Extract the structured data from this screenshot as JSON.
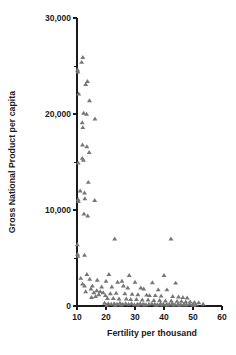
{
  "chart_data": {
    "type": "scatter",
    "title": "",
    "subtitle": "",
    "xlabel": "Fertility per thousand",
    "ylabel": "Gross National Product per capita",
    "xlim": [
      10,
      60
    ],
    "ylim": [
      0,
      30000
    ],
    "xticks": [
      10,
      20,
      30,
      40,
      50,
      60
    ],
    "xtick_labels": [
      "10",
      "20",
      "30",
      "40",
      "50",
      "60"
    ],
    "yticks": [
      0,
      10000,
      20000,
      30000
    ],
    "ytick_labels": [
      "0",
      "10,000",
      "20,000",
      "30,000"
    ],
    "yticks_minor": [
      5000,
      15000,
      25000
    ],
    "grid": false,
    "legend": null,
    "marker": "triangle",
    "marker_color": "#777777",
    "marker_size": 4,
    "axis_color": "#1a1a1a",
    "background_color": "#ffffff",
    "series": [
      {
        "name": "Countries",
        "points": [
          [
            10.2,
            24600
          ],
          [
            10.3,
            24400
          ],
          [
            11.6,
            25400
          ],
          [
            12.0,
            25900
          ],
          [
            10.6,
            22100
          ],
          [
            13.0,
            23100
          ],
          [
            13.6,
            23400
          ],
          [
            14.3,
            21400
          ],
          [
            12.3,
            20100
          ],
          [
            13.3,
            20000
          ],
          [
            16.2,
            19500
          ],
          [
            11.8,
            19100
          ],
          [
            12.0,
            18600
          ],
          [
            11.9,
            16800
          ],
          [
            13.4,
            16600
          ],
          [
            14.2,
            16000
          ],
          [
            11.8,
            15400
          ],
          [
            12.2,
            15200
          ],
          [
            10.4,
            14900
          ],
          [
            13.9,
            12900
          ],
          [
            11.1,
            12000
          ],
          [
            12.6,
            11800
          ],
          [
            10.4,
            11100
          ],
          [
            10.5,
            10900
          ],
          [
            12.7,
            11200
          ],
          [
            16.1,
            11000
          ],
          [
            12.4,
            9600
          ],
          [
            13.7,
            9400
          ],
          [
            10.1,
            6400
          ],
          [
            10.2,
            5400
          ],
          [
            10.3,
            5200
          ],
          [
            12.6,
            5300
          ],
          [
            23.0,
            7000
          ],
          [
            42.4,
            7000
          ],
          [
            13.4,
            3300
          ],
          [
            21.0,
            3300
          ],
          [
            28.0,
            3200
          ],
          [
            40.0,
            3200
          ],
          [
            11.3,
            2900
          ],
          [
            14.4,
            2800
          ],
          [
            17.0,
            2700
          ],
          [
            20.0,
            2600
          ],
          [
            24.0,
            2500
          ],
          [
            25.5,
            2600
          ],
          [
            30.0,
            2500
          ],
          [
            36.0,
            2450
          ],
          [
            44.0,
            2400
          ],
          [
            11.9,
            2300
          ],
          [
            12.6,
            2100
          ],
          [
            15.3,
            2100
          ],
          [
            18.5,
            2000
          ],
          [
            22.0,
            2000
          ],
          [
            26.0,
            2100
          ],
          [
            27.5,
            1900
          ],
          [
            32.0,
            1900
          ],
          [
            33.0,
            1800
          ],
          [
            38.0,
            1700
          ],
          [
            41.0,
            1700
          ],
          [
            13.0,
            1500
          ],
          [
            15.8,
            1400
          ],
          [
            19.0,
            1400
          ],
          [
            21.5,
            1300
          ],
          [
            23.5,
            1350
          ],
          [
            26.5,
            1300
          ],
          [
            29.0,
            1250
          ],
          [
            31.0,
            1200
          ],
          [
            34.0,
            1150
          ],
          [
            35.0,
            1100
          ],
          [
            37.0,
            1100
          ],
          [
            39.0,
            1050
          ],
          [
            43.0,
            1000
          ],
          [
            45.0,
            950
          ],
          [
            46.5,
            900
          ],
          [
            48.0,
            850
          ],
          [
            20.5,
            800
          ],
          [
            22.5,
            800
          ],
          [
            24.5,
            750
          ],
          [
            27.0,
            750
          ],
          [
            28.5,
            700
          ],
          [
            30.5,
            700
          ],
          [
            32.5,
            650
          ],
          [
            34.5,
            650
          ],
          [
            36.5,
            600
          ],
          [
            38.5,
            600
          ],
          [
            40.5,
            550
          ],
          [
            42.5,
            550
          ],
          [
            44.5,
            500
          ],
          [
            46.0,
            500
          ],
          [
            47.5,
            450
          ],
          [
            49.0,
            450
          ],
          [
            50.5,
            400
          ],
          [
            52.0,
            350
          ],
          [
            53.5,
            200
          ],
          [
            19.5,
            300
          ],
          [
            20.8,
            250
          ],
          [
            21.8,
            200
          ],
          [
            22.8,
            250
          ],
          [
            23.8,
            200
          ],
          [
            24.8,
            300
          ],
          [
            25.8,
            200
          ],
          [
            26.8,
            250
          ],
          [
            27.8,
            200
          ],
          [
            28.8,
            250
          ],
          [
            29.8,
            150
          ],
          [
            30.8,
            200
          ],
          [
            31.8,
            250
          ],
          [
            32.8,
            200
          ],
          [
            33.8,
            150
          ],
          [
            34.8,
            200
          ],
          [
            35.8,
            250
          ],
          [
            36.8,
            200
          ],
          [
            37.8,
            150
          ],
          [
            38.8,
            250
          ],
          [
            39.8,
            200
          ],
          [
            40.8,
            150
          ],
          [
            41.8,
            200
          ],
          [
            42.8,
            250
          ],
          [
            43.8,
            150
          ],
          [
            44.8,
            200
          ],
          [
            45.8,
            150
          ],
          [
            46.8,
            200
          ],
          [
            47.8,
            150
          ],
          [
            48.8,
            200
          ],
          [
            49.8,
            150
          ],
          [
            51.0,
            150
          ],
          [
            20.2,
            100
          ],
          [
            23.2,
            100
          ],
          [
            25.2,
            120
          ],
          [
            31.2,
            100
          ],
          [
            33.2,
            120
          ],
          [
            37.2,
            100
          ],
          [
            39.2,
            120
          ],
          [
            41.2,
            100
          ],
          [
            43.2,
            120
          ],
          [
            45.2,
            100
          ],
          [
            47.2,
            120
          ],
          [
            50.2,
            100
          ],
          [
            14.8,
            1800
          ],
          [
            16.8,
            1600
          ],
          [
            18.0,
            1500
          ],
          [
            17.5,
            1200
          ],
          [
            15.0,
            900
          ],
          [
            16.4,
            1000
          ],
          [
            19.8,
            1100
          ]
        ]
      }
    ]
  },
  "figure": {
    "plot_left_px": 77,
    "plot_right_px": 222,
    "plot_bottom_px": 306,
    "plot_top_px": 18
  }
}
